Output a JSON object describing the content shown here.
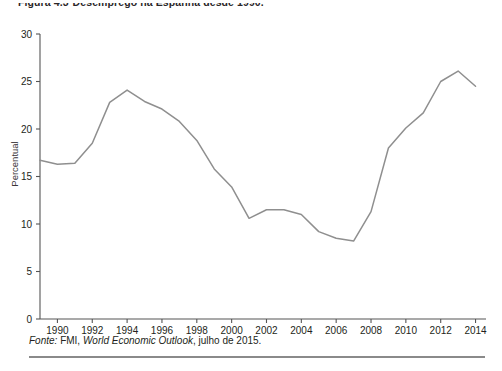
{
  "caption": {
    "figure_number": "Figura 4.3",
    "title": "Desemprego na Espanha desde 1990."
  },
  "source": {
    "label": "Fonte:",
    "text_before": " FMI, ",
    "italic_part": "World Economic Outlook",
    "text_after": ", julho de 2015."
  },
  "chart_data": {
    "type": "line",
    "title": "Desemprego na Espanha desde 1990.",
    "xlabel": "",
    "ylabel": "Percentual",
    "xlim": [
      1989,
      2014.6
    ],
    "ylim": [
      0,
      30
    ],
    "yticks": [
      0,
      5,
      10,
      15,
      20,
      25,
      30
    ],
    "xticks": [
      1990,
      1992,
      1994,
      1996,
      1998,
      2000,
      2002,
      2004,
      2006,
      2008,
      2010,
      2012,
      2014
    ],
    "grid": false,
    "legend": "none",
    "line_color": "#8f8f8f",
    "series": [
      {
        "name": "Desemprego (%)",
        "x": [
          1989,
          1990,
          1991,
          1992,
          1993,
          1994,
          1995,
          1996,
          1997,
          1998,
          1999,
          2000,
          2001,
          2002,
          2003,
          2004,
          2005,
          2006,
          2007,
          2008,
          2009,
          2010,
          2011,
          2012,
          2013,
          2014
        ],
        "values": [
          16.7,
          16.3,
          16.4,
          18.5,
          22.8,
          24.1,
          22.9,
          22.1,
          20.8,
          18.8,
          15.8,
          13.9,
          10.6,
          11.5,
          11.5,
          11.0,
          9.2,
          8.5,
          8.2,
          11.3,
          18.0,
          20.1,
          21.7,
          25.0,
          26.1,
          24.5
        ]
      }
    ]
  }
}
